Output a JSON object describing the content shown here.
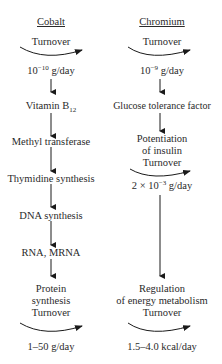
{
  "diagram": {
    "type": "parallel-pathway-flowchart",
    "columns": [
      {
        "header": "Cobalt",
        "nodes": [
          {
            "label": "Turnover",
            "kind": "turnover"
          },
          {
            "label": "10",
            "sup": "−10",
            "suffix": " g/day",
            "kind": "rate"
          },
          {
            "label": "Vitamin B",
            "sub": "12",
            "kind": "step"
          },
          {
            "label": "Methyl transferase",
            "kind": "step"
          },
          {
            "label": "Thymidine synthesis",
            "kind": "step"
          },
          {
            "label": "DNA synthesis",
            "kind": "step"
          },
          {
            "label": "RNA, MRNA",
            "kind": "step"
          },
          {
            "line1": "Protein",
            "line2": "synthesis",
            "line3": "Turnover",
            "kind": "step+turnover"
          },
          {
            "label": "1–50 g/day",
            "kind": "rate"
          }
        ]
      },
      {
        "header": "Chromium",
        "nodes": [
          {
            "label": "Turnover",
            "kind": "turnover"
          },
          {
            "label": "10",
            "sup": "−9",
            "suffix": " g/day",
            "kind": "rate"
          },
          {
            "label": "Glucose tolerance factor",
            "kind": "step"
          },
          {
            "line1": "Potentiation",
            "line2": "of insulin",
            "line3": "Turnover",
            "kind": "step+turnover"
          },
          {
            "prefix": "2 × 10",
            "sup": "−3",
            "suffix": " g/day",
            "kind": "rate"
          },
          {
            "line1": "Regulation",
            "line2": "of energy metabolism",
            "line3": "Turnover",
            "kind": "step+turnover"
          },
          {
            "label": "1.5–4.0 kcal/day",
            "kind": "rate"
          }
        ]
      }
    ]
  }
}
